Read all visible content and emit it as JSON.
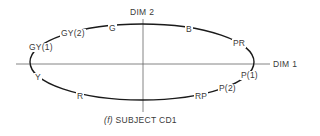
{
  "figure": {
    "caption_prefix": "(f)",
    "caption_text": "SUBJECT CD1",
    "axes": {
      "horizontal_label": "DIM 1",
      "vertical_label": "DIM 2"
    },
    "points": [
      {
        "label": "G",
        "position": "upper-left"
      },
      {
        "label": "B",
        "position": "upper-right"
      },
      {
        "label": "PR",
        "position": "right-upper"
      },
      {
        "label": "P(1)",
        "position": "right-lower"
      },
      {
        "label": "P(2)",
        "position": "lower-right"
      },
      {
        "label": "RP",
        "position": "lower-right"
      },
      {
        "label": "R",
        "position": "lower-left"
      },
      {
        "label": "Y",
        "position": "left-lower"
      },
      {
        "label": "GY(1)",
        "position": "left-upper"
      },
      {
        "label": "GY(2)",
        "position": "upper-left"
      }
    ],
    "colors": {
      "curve": "#1a1a1a",
      "axis": "#555555",
      "text": "#3a3a3a"
    }
  }
}
